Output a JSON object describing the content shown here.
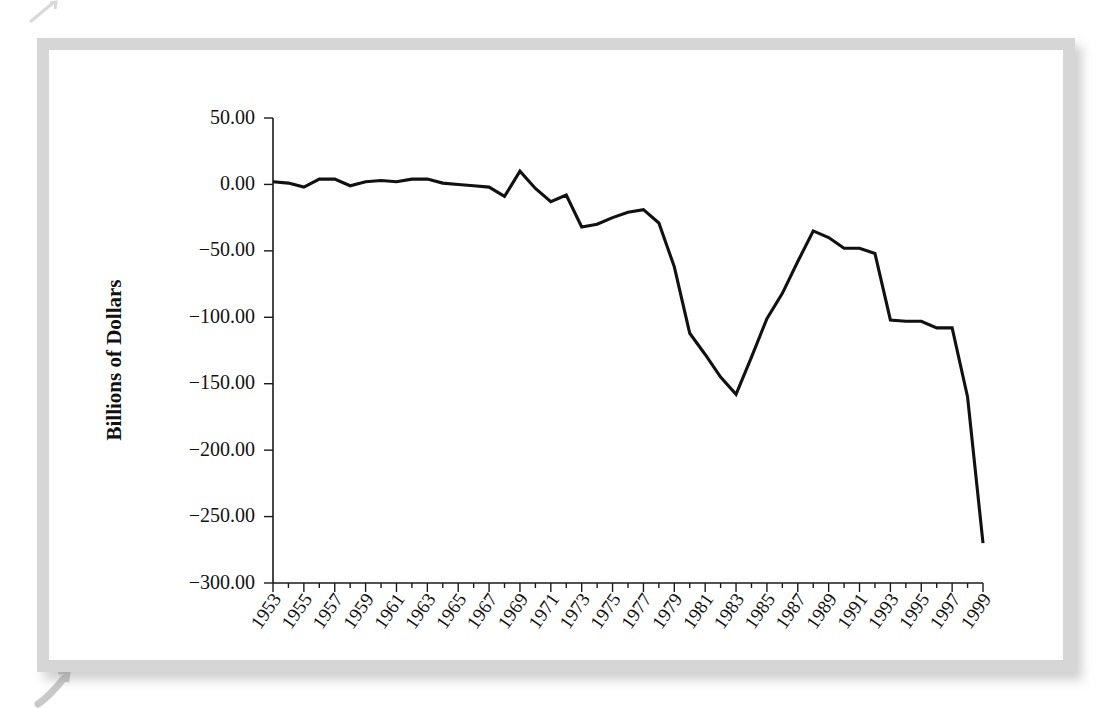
{
  "figure": {
    "frame_color": "#d6d6d6",
    "background": "#ffffff",
    "line_color": "#111111"
  },
  "chart_data": {
    "type": "line",
    "title": "",
    "xlabel": "",
    "ylabel": "Billions of Dollars",
    "ylim": [
      -300,
      50
    ],
    "xlim": [
      1953,
      1999
    ],
    "grid": false,
    "legend": false,
    "ytick_labels": [
      "50.00",
      "0.00",
      "-50.00",
      "-100.00",
      "-150.00",
      "-200.00",
      "-250.00",
      "-300.00"
    ],
    "ytick_values": [
      50,
      0,
      -50,
      -100,
      -150,
      -200,
      -250,
      -300
    ],
    "xtick_labels": [
      "1953",
      "1955",
      "1957",
      "1959",
      "1961",
      "1963",
      "1965",
      "1967",
      "1969",
      "1971",
      "1973",
      "1975",
      "1977",
      "1979",
      "1981",
      "1983",
      "1985",
      "1987",
      "1989",
      "1991",
      "1993",
      "1995",
      "1997",
      "1999"
    ],
    "xtick_values": [
      1953,
      1955,
      1957,
      1959,
      1961,
      1963,
      1965,
      1967,
      1969,
      1971,
      1973,
      1975,
      1977,
      1979,
      1981,
      1983,
      1985,
      1987,
      1989,
      1991,
      1993,
      1995,
      1997,
      1999
    ],
    "x": [
      1953,
      1954,
      1955,
      1956,
      1957,
      1958,
      1959,
      1960,
      1961,
      1962,
      1963,
      1964,
      1965,
      1966,
      1967,
      1968,
      1969,
      1970,
      1971,
      1972,
      1973,
      1974,
      1975,
      1976,
      1977,
      1978,
      1979,
      1980,
      1981,
      1982,
      1983,
      1984,
      1985,
      1986,
      1987,
      1988,
      1989,
      1990,
      1991,
      1992,
      1993,
      1994,
      1995,
      1996,
      1997,
      1998,
      1999
    ],
    "values": [
      2,
      1,
      -2,
      4,
      4,
      -1,
      2,
      3,
      2,
      4,
      4,
      1,
      0,
      -1,
      -2,
      -9,
      10,
      -3,
      -13,
      -8,
      -32,
      -30,
      -25,
      -21,
      -19,
      -29,
      -62,
      -112,
      -128,
      -145,
      -158,
      -130,
      -101,
      -82,
      -58,
      -35,
      -40,
      -48,
      -48,
      -52,
      -102,
      -103,
      -103,
      -108,
      -108,
      -160,
      -270
    ]
  }
}
